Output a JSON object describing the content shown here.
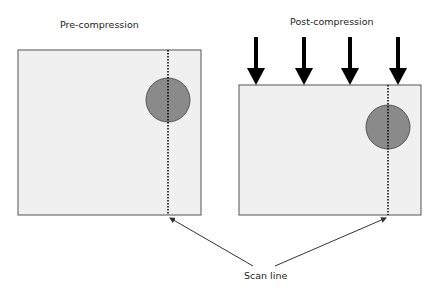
{
  "labels": {
    "pre": "Pre-compression",
    "post": "Post-compression",
    "scan": "Scan line"
  },
  "colors": {
    "box_fill": "#f0f0f0",
    "box_stroke": "#555555",
    "circle_fill": "#8a8a8a",
    "arrow": "#000000"
  },
  "panels": [
    {
      "name": "pre-compression",
      "box": [
        18,
        50,
        183,
        165
      ],
      "circle": [
        168,
        100,
        22
      ],
      "scan_x": 168
    },
    {
      "name": "post-compression",
      "box": [
        239,
        85,
        182,
        130
      ],
      "circle": [
        388,
        127,
        22
      ],
      "scan_x": 388
    }
  ],
  "compression_arrows_x": [
    256,
    304,
    350,
    398
  ]
}
